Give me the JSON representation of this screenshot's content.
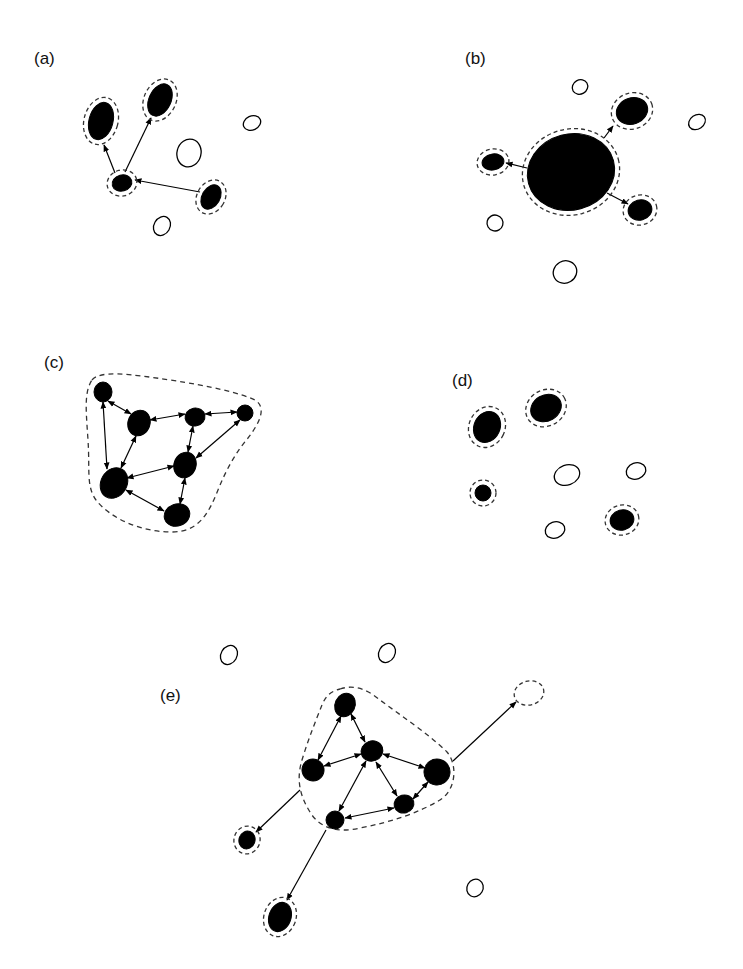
{
  "figure": {
    "colors": {
      "ink": "#000000",
      "dash": "#333333",
      "background": "#ffffff"
    },
    "panels": [
      {
        "id": "a",
        "label": "(a)",
        "label_pos": [
          34,
          50
        ],
        "nodes": [
          {
            "id": "a1",
            "cx": 101,
            "cy": 121,
            "rx": 12,
            "ry": 19,
            "rot": 15,
            "filled": true,
            "halo": true
          },
          {
            "id": "a2",
            "cx": 160,
            "cy": 100,
            "rx": 11,
            "ry": 17,
            "rot": 25,
            "filled": true,
            "halo": true
          },
          {
            "id": "a3",
            "cx": 122,
            "cy": 183,
            "rx": 10,
            "ry": 8,
            "rot": -15,
            "filled": true,
            "halo": true
          },
          {
            "id": "a4",
            "cx": 211,
            "cy": 197,
            "rx": 9,
            "ry": 13,
            "rot": 30,
            "filled": true,
            "halo": true
          },
          {
            "id": "a5",
            "cx": 189,
            "cy": 153,
            "rx": 12,
            "ry": 14,
            "rot": 15,
            "filled": false,
            "halo": false
          },
          {
            "id": "a6",
            "cx": 252,
            "cy": 123,
            "rx": 9,
            "ry": 7,
            "rot": -25,
            "filled": false,
            "halo": false
          },
          {
            "id": "a7",
            "cx": 162,
            "cy": 226,
            "rx": 8,
            "ry": 10,
            "rot": 30,
            "filled": false,
            "halo": false
          }
        ],
        "edges": [
          {
            "from": [
              115,
              173
            ],
            "to": [
              104,
              145
            ],
            "heads": "end"
          },
          {
            "from": [
              125,
              172
            ],
            "to": [
              151,
              118
            ],
            "heads": "end"
          },
          {
            "from": [
              200,
              192
            ],
            "to": [
              135,
              180
            ],
            "heads": "end"
          }
        ],
        "outlines": []
      },
      {
        "id": "b",
        "label": "(b)",
        "label_pos": [
          465,
          50
        ],
        "nodes": [
          {
            "id": "b1",
            "cx": 571,
            "cy": 172,
            "rx": 44,
            "ry": 38,
            "rot": -15,
            "filled": true,
            "halo": true
          },
          {
            "id": "b2",
            "cx": 632,
            "cy": 111,
            "rx": 16,
            "ry": 13,
            "rot": -20,
            "filled": true,
            "halo": true
          },
          {
            "id": "b3",
            "cx": 493,
            "cy": 162,
            "rx": 11,
            "ry": 8,
            "rot": -10,
            "filled": true,
            "halo": true
          },
          {
            "id": "b4",
            "cx": 640,
            "cy": 210,
            "rx": 12,
            "ry": 10,
            "rot": -15,
            "filled": true,
            "halo": true
          },
          {
            "id": "b5",
            "cx": 580,
            "cy": 87,
            "rx": 8,
            "ry": 7,
            "rot": -30,
            "filled": false,
            "halo": false
          },
          {
            "id": "b6",
            "cx": 697,
            "cy": 122,
            "rx": 9,
            "ry": 7,
            "rot": -35,
            "filled": false,
            "halo": false
          },
          {
            "id": "b7",
            "cx": 495,
            "cy": 223,
            "rx": 8,
            "ry": 8,
            "rot": -30,
            "filled": false,
            "halo": false
          },
          {
            "id": "b8",
            "cx": 565,
            "cy": 272,
            "rx": 12,
            "ry": 11,
            "rot": -30,
            "filled": false,
            "halo": false
          }
        ],
        "edges": [
          {
            "from": [
              527,
              168
            ],
            "to": [
              506,
              163
            ],
            "heads": "end"
          },
          {
            "from": [
              604,
              138
            ],
            "to": [
              613,
              126
            ],
            "heads": "end"
          },
          {
            "from": [
              607,
              193
            ],
            "to": [
              628,
              204
            ],
            "heads": "end"
          }
        ],
        "outlines": []
      },
      {
        "id": "c",
        "label": "(c)",
        "label_pos": [
          44,
          354
        ],
        "nodes": [
          {
            "id": "c1",
            "cx": 103,
            "cy": 392,
            "rx": 9,
            "ry": 10,
            "rot": 0,
            "filled": true,
            "halo": false
          },
          {
            "id": "c2",
            "cx": 139,
            "cy": 423,
            "rx": 11,
            "ry": 13,
            "rot": 20,
            "filled": true,
            "halo": false
          },
          {
            "id": "c3",
            "cx": 195,
            "cy": 417,
            "rx": 10,
            "ry": 9,
            "rot": -10,
            "filled": true,
            "halo": false
          },
          {
            "id": "c4",
            "cx": 245,
            "cy": 413,
            "rx": 8,
            "ry": 8,
            "rot": 0,
            "filled": true,
            "halo": false
          },
          {
            "id": "c5",
            "cx": 185,
            "cy": 465,
            "rx": 11,
            "ry": 13,
            "rot": 20,
            "filled": true,
            "halo": false
          },
          {
            "id": "c6",
            "cx": 114,
            "cy": 483,
            "rx": 13,
            "ry": 16,
            "rot": 30,
            "filled": true,
            "halo": false
          },
          {
            "id": "c7",
            "cx": 177,
            "cy": 515,
            "rx": 13,
            "ry": 11,
            "rot": -20,
            "filled": true,
            "halo": false
          }
        ],
        "edges": [
          {
            "from": [
              108,
              401
            ],
            "to": [
              131,
              414
            ],
            "heads": "both"
          },
          {
            "from": [
              103,
              402
            ],
            "to": [
              107,
              469
            ],
            "heads": "both"
          },
          {
            "from": [
              150,
              420
            ],
            "to": [
              185,
              414
            ],
            "heads": "both"
          },
          {
            "from": [
              205,
              414
            ],
            "to": [
              237,
              412
            ],
            "heads": "both"
          },
          {
            "from": [
              136,
              436
            ],
            "to": [
              121,
              468
            ],
            "heads": "both"
          },
          {
            "from": [
              193,
              426
            ],
            "to": [
              188,
              452
            ],
            "heads": "both"
          },
          {
            "from": [
              240,
              420
            ],
            "to": [
              196,
              458
            ],
            "heads": "both"
          },
          {
            "from": [
              127,
              478
            ],
            "to": [
              174,
              466
            ],
            "heads": "both"
          },
          {
            "from": [
              185,
              478
            ],
            "to": [
              180,
              504
            ],
            "heads": "both"
          },
          {
            "from": [
              126,
              490
            ],
            "to": [
              164,
              511
            ],
            "heads": "both"
          }
        ],
        "outlines": [
          {
            "d": "M 92 380 C 100 370, 130 374, 170 380 C 210 386, 240 393, 255 400 C 268 408, 258 425, 248 438 C 236 452, 226 470, 218 490 C 208 515, 198 532, 172 532 C 140 532, 110 518, 96 500 C 86 486, 90 470, 88 440 C 86 410, 84 392, 92 380 Z"
          }
        ]
      },
      {
        "id": "d",
        "label": "(d)",
        "label_pos": [
          452,
          372
        ],
        "nodes": [
          {
            "id": "d1",
            "cx": 487,
            "cy": 427,
            "rx": 13,
            "ry": 16,
            "rot": 25,
            "filled": true,
            "halo": true
          },
          {
            "id": "d2",
            "cx": 546,
            "cy": 408,
            "rx": 16,
            "ry": 13,
            "rot": -30,
            "filled": true,
            "halo": true
          },
          {
            "id": "d3",
            "cx": 483,
            "cy": 493,
            "rx": 8,
            "ry": 8,
            "rot": 0,
            "filled": true,
            "halo": true
          },
          {
            "id": "d4",
            "cx": 622,
            "cy": 520,
            "rx": 12,
            "ry": 10,
            "rot": -15,
            "filled": true,
            "halo": true
          },
          {
            "id": "d5",
            "cx": 567,
            "cy": 475,
            "rx": 13,
            "ry": 10,
            "rot": -20,
            "filled": false,
            "halo": false
          },
          {
            "id": "d6",
            "cx": 636,
            "cy": 471,
            "rx": 10,
            "ry": 8,
            "rot": -20,
            "filled": false,
            "halo": false
          },
          {
            "id": "d7",
            "cx": 555,
            "cy": 530,
            "rx": 10,
            "ry": 8,
            "rot": -20,
            "filled": false,
            "halo": false
          }
        ],
        "edges": [],
        "outlines": []
      },
      {
        "id": "e",
        "label": "(e)",
        "label_pos": [
          160,
          687
        ],
        "nodes": [
          {
            "id": "e1",
            "cx": 345,
            "cy": 705,
            "rx": 10,
            "ry": 12,
            "rot": 25,
            "filled": true,
            "halo": false
          },
          {
            "id": "e2",
            "cx": 372,
            "cy": 751,
            "rx": 11,
            "ry": 10,
            "rot": -20,
            "filled": true,
            "halo": false
          },
          {
            "id": "e3",
            "cx": 313,
            "cy": 770,
            "rx": 11,
            "ry": 11,
            "rot": 20,
            "filled": true,
            "halo": false
          },
          {
            "id": "e4",
            "cx": 437,
            "cy": 772,
            "rx": 13,
            "ry": 13,
            "rot": 10,
            "filled": true,
            "halo": false
          },
          {
            "id": "e5",
            "cx": 404,
            "cy": 804,
            "rx": 10,
            "ry": 9,
            "rot": -15,
            "filled": true,
            "halo": false
          },
          {
            "id": "e6",
            "cx": 335,
            "cy": 820,
            "rx": 9,
            "ry": 9,
            "rot": 0,
            "filled": true,
            "halo": false
          },
          {
            "id": "e7",
            "cx": 247,
            "cy": 840,
            "rx": 8,
            "ry": 9,
            "rot": 20,
            "filled": true,
            "halo": true
          },
          {
            "id": "e8",
            "cx": 280,
            "cy": 917,
            "rx": 11,
            "ry": 15,
            "rot": 20,
            "filled": true,
            "halo": true
          },
          {
            "id": "e9",
            "cx": 529,
            "cy": 693,
            "rx": 15,
            "ry": 12,
            "rot": -15,
            "filled": false,
            "halo": false,
            "dashed": true
          },
          {
            "id": "e10",
            "cx": 229,
            "cy": 655,
            "rx": 8,
            "ry": 10,
            "rot": 30,
            "filled": false,
            "halo": false
          },
          {
            "id": "e11",
            "cx": 387,
            "cy": 653,
            "rx": 8,
            "ry": 10,
            "rot": 30,
            "filled": false,
            "halo": false
          },
          {
            "id": "e12",
            "cx": 475,
            "cy": 888,
            "rx": 8,
            "ry": 9,
            "rot": 30,
            "filled": false,
            "halo": false
          }
        ],
        "edges": [
          {
            "from": [
              341,
              716
            ],
            "to": [
              318,
              760
            ],
            "heads": "both"
          },
          {
            "from": [
              351,
              714
            ],
            "to": [
              365,
              742
            ],
            "heads": "both"
          },
          {
            "from": [
              324,
              766
            ],
            "to": [
              361,
              754
            ],
            "heads": "both"
          },
          {
            "from": [
              383,
              754
            ],
            "to": [
              425,
              768
            ],
            "heads": "both"
          },
          {
            "from": [
              366,
              761
            ],
            "to": [
              339,
              811
            ],
            "heads": "both"
          },
          {
            "from": [
              376,
              762
            ],
            "to": [
              397,
              796
            ],
            "heads": "both"
          },
          {
            "from": [
              345,
              818
            ],
            "to": [
              394,
              808
            ],
            "heads": "both"
          },
          {
            "from": [
              413,
              799
            ],
            "to": [
              428,
              782
            ],
            "heads": "both"
          },
          {
            "from": [
              453,
              761
            ],
            "to": [
              516,
              702
            ],
            "heads": "end"
          },
          {
            "from": [
              300,
              790
            ],
            "to": [
              256,
              832
            ],
            "heads": "end"
          },
          {
            "from": [
              326,
              830
            ],
            "to": [
              287,
              900
            ],
            "heads": "end"
          }
        ],
        "outlines": [
          {
            "d": "M 340 689 C 355 684, 368 690, 380 700 C 400 715, 430 735, 447 752 C 458 765, 456 790, 440 800 C 420 812, 392 822, 360 828 C 335 834, 318 826, 310 812 C 300 796, 296 780, 302 760 C 308 740, 316 720, 322 705 C 326 695, 332 691, 340 689 Z"
          }
        ]
      }
    ]
  }
}
